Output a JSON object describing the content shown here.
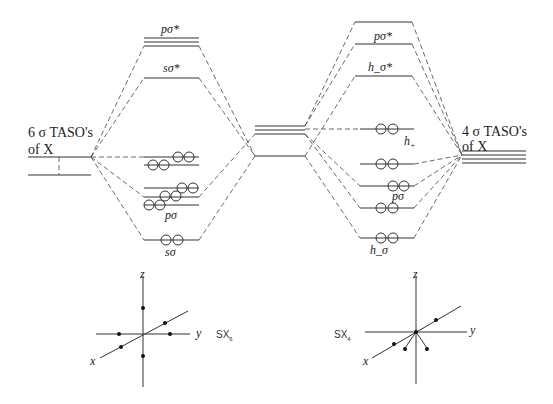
{
  "left_diagram": {
    "ligand_label_line1": "6 σ TASO's",
    "ligand_label_line2": "of X",
    "mo_labels": {
      "p_sigma_star": "pσ*",
      "s_sigma_star": "sσ*",
      "p_sigma": "pσ",
      "s_sigma": "sσ"
    },
    "molecule_label": "SX",
    "molecule_subscript": "6"
  },
  "right_diagram": {
    "ligand_label_line1": "4 σ TASO's",
    "ligand_label_line2": "of X",
    "mo_labels": {
      "p_sigma_star": "pσ*",
      "h_minus_sigma_star": "h_σ*",
      "h_plus": "h",
      "h_plus_sub": "+",
      "p_sigma": "pσ",
      "h_minus_sigma": "h_σ"
    },
    "molecule_label": "SX",
    "molecule_subscript": "4"
  },
  "axes": {
    "x": "x",
    "y": "y",
    "z": "z"
  }
}
